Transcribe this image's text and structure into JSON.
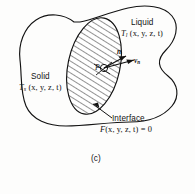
{
  "figure": {
    "caption": "(c)",
    "regions": {
      "liquid": {
        "name": "Liquid",
        "temperature_field": "T",
        "temperature_subscript": "l",
        "temperature_args": "(x, y, z, t)"
      },
      "solid": {
        "name": "Solid",
        "temperature_field": "T",
        "temperature_subscript": "s",
        "temperature_args": "(x, y, z, t)"
      }
    },
    "interface": {
      "label": "Interface",
      "equation_lhs": "F",
      "equation_args": "(x, y, z, t)",
      "equation_rhs": "= 0"
    },
    "annotations": {
      "point_label": "P",
      "normal_vector_label": "n",
      "normal_velocity_label": "v",
      "normal_velocity_subscript": "n"
    },
    "colors": {
      "background": "#fdfdfc",
      "ink": "#121212",
      "hatch": "#1a1a1a"
    }
  }
}
